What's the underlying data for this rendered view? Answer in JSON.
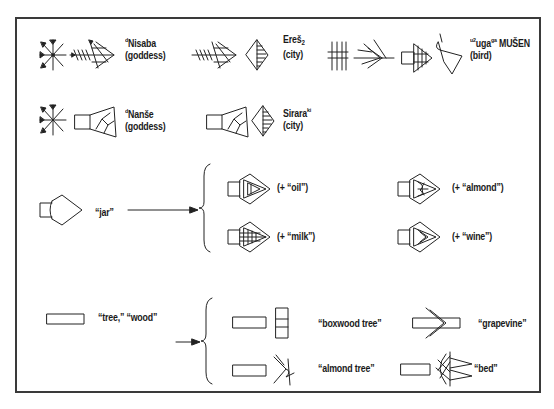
{
  "diagram": {
    "type": "cuneiform-sign-composition",
    "frame_color": "#3a3a3a"
  },
  "compounds": [
    {
      "id": "nisaba",
      "det": "d",
      "name": "Nisaba",
      "gloss": "(goddess)"
    },
    {
      "id": "eresh",
      "name": "Ereš",
      "sub": "2",
      "gloss": "(city)"
    },
    {
      "id": "uga",
      "prefix": "u2",
      "name": "uga",
      "sup": "ga",
      "suffix": " MUŠEN",
      "gloss": "(bird)"
    },
    {
      "id": "nanshe",
      "det": "d",
      "name": "Nanše",
      "gloss": "(goddess)"
    },
    {
      "id": "sirara",
      "name": "Sirara",
      "sup": "ki",
      "gloss": "(city)"
    }
  ],
  "jar_group": {
    "base_label": "“jar”",
    "derived": [
      {
        "id": "oil",
        "label": "(+ “oil”)"
      },
      {
        "id": "almond",
        "label": "(+ “almond”)"
      },
      {
        "id": "milk",
        "label": "(+ “milk”)"
      },
      {
        "id": "wine",
        "label": "(+ “wine”)"
      }
    ]
  },
  "wood_group": {
    "base_label": "“tree,” “wood”",
    "derived": [
      {
        "id": "boxwood",
        "label": "“boxwood tree”"
      },
      {
        "id": "grapevine",
        "label": "“grapevine”"
      },
      {
        "id": "almond-tree",
        "label": "“almond tree”"
      },
      {
        "id": "bed",
        "label": "“bed”"
      }
    ]
  }
}
